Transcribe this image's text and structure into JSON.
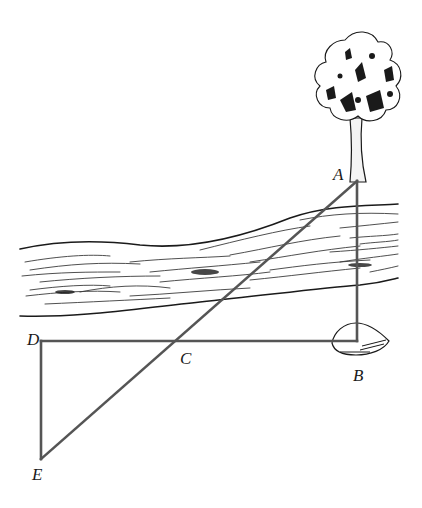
{
  "figure": {
    "points": {
      "A": {
        "label": "A",
        "x": 357,
        "y": 181
      },
      "B": {
        "label": "B",
        "x": 357,
        "y": 341
      },
      "C": {
        "label": "C",
        "x": 175,
        "y": 341
      },
      "D": {
        "label": "D",
        "x": 41,
        "y": 341
      },
      "E": {
        "label": "E",
        "x": 41,
        "y": 459
      }
    },
    "segments": [
      {
        "from": "A",
        "to": "B"
      },
      {
        "from": "D",
        "to": "B"
      },
      {
        "from": "A",
        "to": "E"
      },
      {
        "from": "D",
        "to": "E"
      }
    ],
    "objects": [
      "tree",
      "river",
      "rock"
    ],
    "colors": {
      "line": "#555555",
      "ink": "#1a1a1a"
    }
  }
}
